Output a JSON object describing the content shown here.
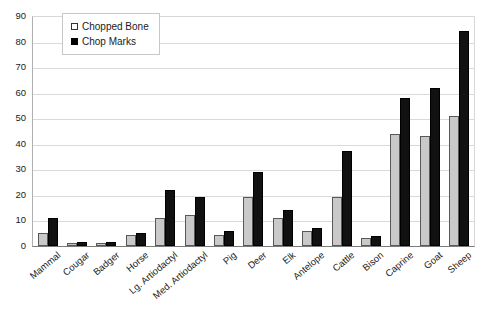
{
  "chart_data": {
    "type": "bar",
    "title": "",
    "subtitle": "",
    "xlabel": "",
    "ylabel": "",
    "ylim": [
      0,
      90
    ],
    "ytick_labels": [
      "0",
      "10",
      "20",
      "30",
      "40",
      "50",
      "60",
      "70",
      "80",
      "90"
    ],
    "ytick_values": [
      0,
      10,
      20,
      30,
      40,
      50,
      60,
      70,
      80,
      90
    ],
    "grid": true,
    "legend_position": "top-left",
    "categories": [
      "Mammal",
      "Cougar",
      "Badger",
      "Horse",
      "Lg. Artiodactyl",
      "Med. Artiodactyl",
      "Pig",
      "Deer",
      "Elk",
      "Antelope",
      "Cattle",
      "Bison",
      "Caprine",
      "Goat",
      "Sheep"
    ],
    "series": [
      {
        "name": "Chopped Bone",
        "color": "#c9c9c9",
        "values": [
          5,
          1,
          1,
          4.5,
          11,
          12,
          4.5,
          19,
          11,
          6,
          19,
          3,
          44,
          43,
          51
        ]
      },
      {
        "name": "Chop Marks",
        "color": "#111111",
        "values": [
          11,
          1.5,
          1.5,
          5,
          22,
          19,
          6,
          29,
          14,
          7,
          37,
          4,
          58,
          62,
          84
        ]
      }
    ]
  },
  "legend": {
    "items": [
      {
        "label": "Chopped Bone",
        "style": "light"
      },
      {
        "label": "Chop Marks",
        "style": "dark"
      }
    ]
  }
}
